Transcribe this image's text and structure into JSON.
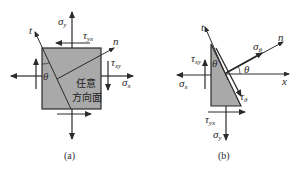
{
  "figure": {
    "colors": {
      "fill": "#a9a9a9",
      "stroke": "#2a2a2a",
      "background": "#ffffff"
    },
    "panel_a": {
      "caption": "(a)",
      "element_label_line1": "任意",
      "element_label_line2": "方向面",
      "axis_t": "t",
      "axis_n": "n",
      "angle": "θ",
      "sigma_y": {
        "sym": "σ",
        "sub": "y"
      },
      "tau_yx": {
        "sym": "τ",
        "sub": "yx"
      },
      "tau_xy": {
        "sym": "τ",
        "sub": "xy"
      },
      "sigma_x": {
        "sym": "σ",
        "sub": "x"
      }
    },
    "panel_b": {
      "caption": "(b)",
      "axis_t": "t",
      "axis_n": "n",
      "axis_x": "x",
      "angle_top": "θ",
      "angle_right": "θ",
      "sigma_theta": {
        "sym": "σ",
        "sub": "θ"
      },
      "tau_theta": {
        "sym": "τ",
        "sub": "θ"
      },
      "tau_xy": {
        "sym": "τ",
        "sub": "xy"
      },
      "sigma_x": {
        "sym": "σ",
        "sub": "x"
      },
      "tau_yx": {
        "sym": "τ",
        "sub": "yx"
      },
      "sigma_y": {
        "sym": "σ",
        "sub": "y"
      }
    }
  }
}
